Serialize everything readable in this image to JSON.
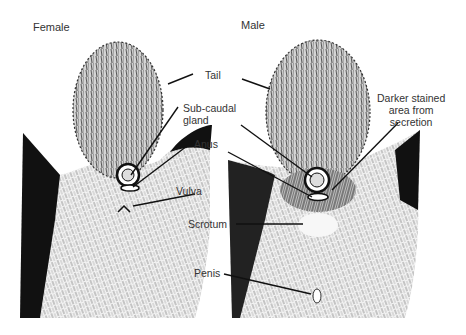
{
  "panels": [
    {
      "id": "female",
      "title": "Female"
    },
    {
      "id": "male",
      "title": "Male"
    }
  ],
  "labels": {
    "tail": "Tail",
    "subcaudal_line1": "Sub-caudal",
    "subcaudal_line2": "gland",
    "anus": "Anus",
    "vulva": "Vulva",
    "scrotum": "Scrotum",
    "penis": "Penis",
    "stain_line1": "Darker stained",
    "stain_line2": "area from",
    "stain_line3": "secretion"
  },
  "colors": {
    "ink": "#111111",
    "background": "#ffffff",
    "fur_mid": "#9a9a9a"
  }
}
